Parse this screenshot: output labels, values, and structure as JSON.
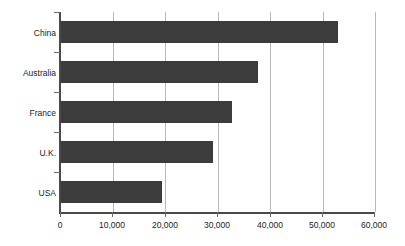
{
  "chart_data": {
    "type": "bar",
    "orientation": "horizontal",
    "title": "",
    "subtitle": "",
    "xlabel": "",
    "ylabel": "",
    "categories": [
      "China",
      "Australia",
      "France",
      "U.K.",
      "USA"
    ],
    "values": [
      52900,
      37700,
      32700,
      29100,
      19400
    ],
    "series": [
      {
        "name": "",
        "values": [
          52900,
          37700,
          32700,
          29100,
          19400
        ]
      }
    ],
    "xlim": [
      0,
      60000
    ],
    "xticks": [
      0,
      10000,
      20000,
      30000,
      40000,
      50000,
      60000
    ],
    "xtick_labels": [
      "0",
      "10,000",
      "20,000",
      "30,000",
      "40,000",
      "50,000",
      "60,000"
    ],
    "grid": true,
    "grid_axis": "x",
    "legend": false,
    "legend_position": "none",
    "annotations": [],
    "colors": {
      "bar": "#3c3c3c",
      "grid": "#b8b8b8",
      "axis": "#4a4a4a",
      "text": "#1d1d1d",
      "background": "#ffffff"
    }
  }
}
